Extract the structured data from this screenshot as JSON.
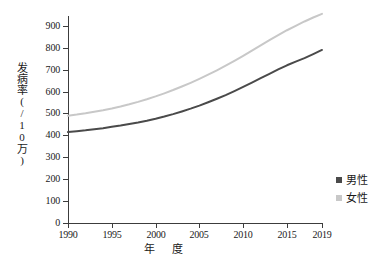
{
  "chart_data": {
    "type": "line",
    "title": "",
    "xlabel": "年　度",
    "ylabel": "发病率(/10万)",
    "xlim": [
      1990,
      2019
    ],
    "ylim": [
      0,
      945
    ],
    "grid": false,
    "legend_position": "right",
    "x_ticks": [
      "1990",
      "1995",
      "2000",
      "2005",
      "2010",
      "2015",
      "2019"
    ],
    "x_tick_values": [
      1990,
      1995,
      2000,
      2005,
      2010,
      2015,
      2019
    ],
    "y_ticks": [
      "0",
      "100",
      "200",
      "300",
      "400",
      "500",
      "600",
      "700",
      "800",
      "900"
    ],
    "y_tick_values": [
      0,
      100,
      200,
      300,
      400,
      500,
      600,
      700,
      800,
      900
    ],
    "x": [
      1990,
      1991,
      1992,
      1993,
      1994,
      1995,
      1996,
      1997,
      1998,
      1999,
      2000,
      2001,
      2002,
      2003,
      2004,
      2005,
      2006,
      2007,
      2008,
      2009,
      2010,
      2011,
      2012,
      2013,
      2014,
      2015,
      2016,
      2017,
      2018,
      2019
    ],
    "series": [
      {
        "name": "男性",
        "color": "#4a4a4a",
        "values": [
          415,
          419,
          423,
          428,
          433,
          439,
          445,
          452,
          459,
          467,
          476,
          486,
          497,
          509,
          522,
          536,
          551,
          567,
          584,
          602,
          621,
          641,
          661,
          681,
          701,
          720,
          737,
          753,
          771,
          790
        ]
      },
      {
        "name": "女性",
        "color": "#c8c8c8",
        "values": [
          490,
          495,
          501,
          508,
          515,
          523,
          532,
          542,
          553,
          565,
          578,
          592,
          607,
          623,
          640,
          658,
          677,
          697,
          718,
          740,
          763,
          787,
          811,
          835,
          858,
          880,
          900,
          920,
          938,
          955
        ]
      }
    ]
  },
  "legend": {
    "items": [
      {
        "label": "男性",
        "color": "#4a4a4a",
        "marker": "square-marker"
      },
      {
        "label": "女性",
        "color": "#c8c8c8",
        "marker": "square-marker"
      }
    ]
  },
  "axes": {
    "y_title": "发病率(/10万)",
    "x_title": "年　度"
  }
}
